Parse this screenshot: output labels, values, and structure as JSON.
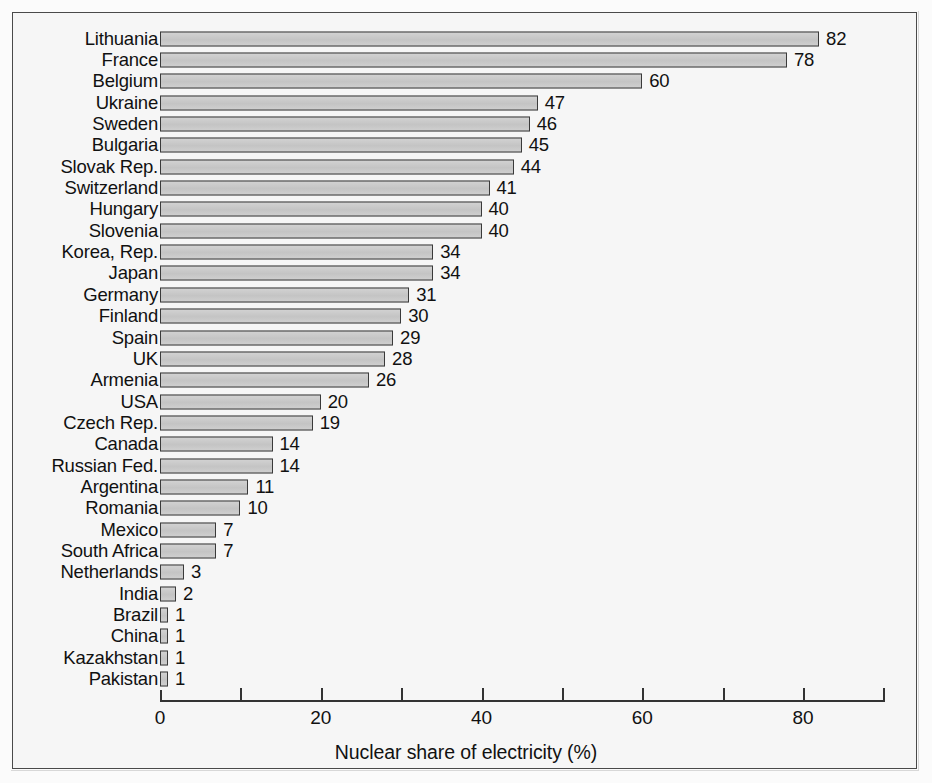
{
  "chart_data": {
    "type": "bar",
    "orientation": "horizontal",
    "title": "",
    "xlabel": "Nuclear share of electricity (%)",
    "ylabel": "",
    "xlim": [
      0,
      90
    ],
    "grid": false,
    "legend": null,
    "x_ticks_major": [
      0,
      20,
      40,
      60,
      80
    ],
    "x_ticks_minor": [
      10,
      30,
      50,
      70,
      90
    ],
    "x_tick_labels": [
      "0",
      "20",
      "40",
      "60",
      "80"
    ],
    "categories": [
      "Lithuania",
      "France",
      "Belgium",
      "Ukraine",
      "Sweden",
      "Bulgaria",
      "Slovak Rep.",
      "Switzerland",
      "Hungary",
      "Slovenia",
      "Korea, Rep.",
      "Japan",
      "Germany",
      "Finland",
      "Spain",
      "UK",
      "Armenia",
      "USA",
      "Czech Rep.",
      "Canada",
      "Russian Fed.",
      "Argentina",
      "Romania",
      "Mexico",
      "South Africa",
      "Netherlands",
      "India",
      "Brazil",
      "China",
      "Kazakhstan",
      "Pakistan"
    ],
    "values": [
      82,
      78,
      60,
      47,
      46,
      45,
      44,
      41,
      40,
      40,
      34,
      34,
      31,
      30,
      29,
      28,
      26,
      20,
      19,
      14,
      14,
      11,
      10,
      7,
      7,
      3,
      2,
      1,
      1,
      1,
      1
    ],
    "data_labels": [
      "82",
      "78",
      "60",
      "47",
      "46",
      "45",
      "44",
      "41",
      "40",
      "40",
      "34",
      "34",
      "31",
      "30",
      "29",
      "28",
      "26",
      "20",
      "19",
      "14",
      "14",
      "11",
      "10",
      "7",
      "7",
      "3",
      "2",
      "1",
      "1",
      "1",
      "1"
    ],
    "colors": {
      "bar_fill": "#c9c9c9",
      "bar_edge": "#3a3a3a",
      "background": "#f6f6f6",
      "frame": "#4a4a4a",
      "text": "#111111",
      "axis": "#333333"
    }
  }
}
